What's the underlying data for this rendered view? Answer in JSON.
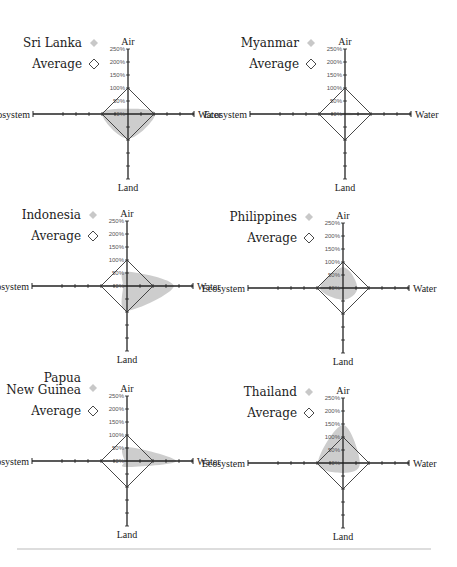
{
  "chart_data": {
    "type": "radar",
    "axes": [
      "Air",
      "Water",
      "Land",
      "Ecosystem"
    ],
    "tick_labels": [
      "0%",
      "50%",
      "100%",
      "150%",
      "200%",
      "250%"
    ],
    "range": [
      0,
      250
    ],
    "units": "%",
    "average_label": "Average",
    "average_values": {
      "Air": 100,
      "Water": 100,
      "Land": 100,
      "Ecosystem": 100
    },
    "colors": {
      "country_fill": "#c8c8c8",
      "average_stroke": "#333333",
      "axis": "#222222"
    },
    "panels": [
      {
        "country": [
          "Sri Lanka"
        ],
        "values": {
          "Air": 20,
          "Water": 105,
          "Land": 95,
          "Ecosystem": 100
        }
      },
      {
        "country": [
          "Myanmar"
        ],
        "values": {
          "Air": 5,
          "Water": 100,
          "Land": 5,
          "Ecosystem": 20
        }
      },
      {
        "country": [
          "Indonesia"
        ],
        "values": {
          "Air": 55,
          "Water": 180,
          "Land": 95,
          "Ecosystem": 15
        }
      },
      {
        "country": [
          "Philippines"
        ],
        "values": {
          "Air": 80,
          "Water": 55,
          "Land": 45,
          "Ecosystem": 88
        }
      },
      {
        "country": [
          "Papua",
          "New Guinea"
        ],
        "values": {
          "Air": 54,
          "Water": 190,
          "Land": 23,
          "Ecosystem": 10
        }
      },
      {
        "country": [
          "Thailand"
        ],
        "values": {
          "Air": 146,
          "Water": 65,
          "Land": 38,
          "Ecosystem": 96
        }
      }
    ]
  }
}
